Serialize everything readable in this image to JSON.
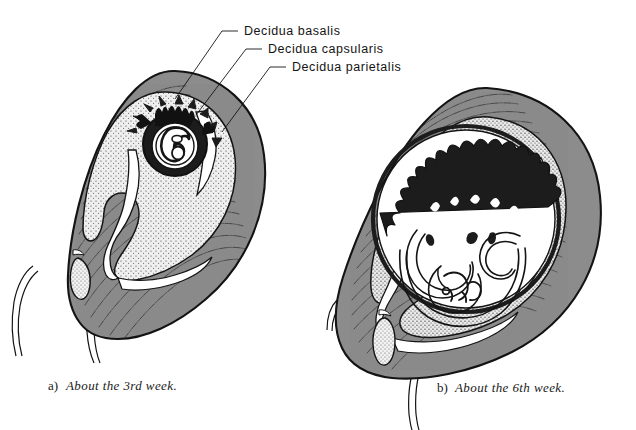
{
  "figure": {
    "title_semantic": "decidua-development-diagram",
    "background_color": "#ffffff",
    "ink_color": "#141414",
    "myometrium_fill": "#8c8c8c",
    "decidua_stipple_fill": "#e4e4e4",
    "lumen_fill": "#ffffff",
    "villi_fill": "#1a1a1a",
    "mucus_plug_fill": "#ededed"
  },
  "labels": [
    {
      "id": "decidua-basalis",
      "text": "Decidua basalis",
      "text_x": 244,
      "text_y": 35,
      "leader": "M 238,31 L 222,31 L 175,99"
    },
    {
      "id": "decidua-capsularis",
      "text": "Decidua capsularis",
      "text_x": 268,
      "text_y": 53,
      "leader": "M 262,49 L 246,49 L 196,115"
    },
    {
      "id": "decidua-parietalis",
      "text": "Decidua parietalis",
      "text_x": 292,
      "text_y": 71,
      "leader": "M 286,67 L 270,67 L 222,132"
    }
  ],
  "captions": [
    {
      "id": "caption-a",
      "index": "a)",
      "text": "About the 3rd week.",
      "x": 48,
      "y": 390
    },
    {
      "id": "caption-b",
      "index": "b)",
      "text": "About the 6th week.",
      "x": 437,
      "y": 392
    }
  ],
  "panels": [
    {
      "id": "panel-a",
      "stage": "About the 3rd week.",
      "structures": [
        "myometrium",
        "decidua-parietalis",
        "decidua-capsularis",
        "decidua-basalis",
        "chorionic-villi",
        "embryo",
        "uterine-cavity",
        "cervical-canal",
        "mucus-plug",
        "vagina-wall"
      ]
    },
    {
      "id": "panel-b",
      "stage": "About the 6th week.",
      "structures": [
        "myometrium",
        "decidua-parietalis",
        "decidua-capsularis",
        "decidua-basalis",
        "chorionic-villi",
        "embryo",
        "amniotic-cavity",
        "chorionic-cavity",
        "uterine-cavity",
        "cervical-canal",
        "mucus-plug",
        "vagina-wall"
      ]
    }
  ]
}
